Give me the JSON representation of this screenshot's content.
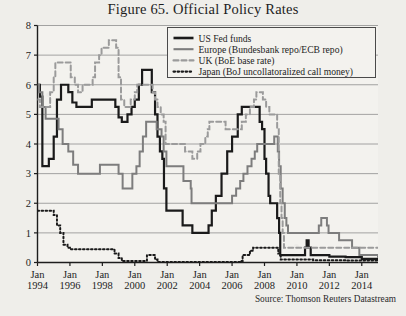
{
  "figure": {
    "title": "Figure 65. Official Policy Rates",
    "source": "Source: Thomson Reuters Datastream"
  },
  "chart_data": {
    "type": "line",
    "title": "Figure 65. Official Policy Rates",
    "xlabel": "",
    "ylabel": "",
    "ylim": [
      0,
      8
    ],
    "xlim": [
      1994,
      2015
    ],
    "grid": true,
    "legend_position": "top-right",
    "yticks": [
      0,
      1,
      2,
      3,
      4,
      5,
      6,
      7,
      8
    ],
    "xticks": [
      1994,
      1996,
      1998,
      2000,
      2002,
      2004,
      2006,
      2008,
      2010,
      2012,
      2014
    ],
    "xtick_labels": [
      "Jan\n1994",
      "Jan\n1996",
      "Jan\n1998",
      "Jan\n2000",
      "Jan\n2002",
      "Jan\n2004",
      "Jan\n2006",
      "Jan\n2008",
      "Jan\n2010",
      "Jan\n2012",
      "Jan\n2014"
    ],
    "xtick_top": [
      "Jan",
      "Jan",
      "Jan",
      "Jan",
      "Jan",
      "Jan",
      "Jan",
      "Jan",
      "Jan",
      "Jan",
      "Jan"
    ],
    "xtick_bottom": [
      "1994",
      "1996",
      "1998",
      "2000",
      "2002",
      "2004",
      "2006",
      "2008",
      "2010",
      "2012",
      "2014"
    ],
    "series": [
      {
        "name": "US Fed funds",
        "legend_label": "US Fed funds",
        "color": "#1a1a1a",
        "style": "solid",
        "width": 2.2,
        "points": [
          [
            1994.0,
            6.0
          ],
          [
            1994.15,
            5.6
          ],
          [
            1994.3,
            3.25
          ],
          [
            1994.5,
            3.25
          ],
          [
            1994.7,
            3.5
          ],
          [
            1995.0,
            4.25
          ],
          [
            1995.2,
            5.5
          ],
          [
            1995.45,
            6.0
          ],
          [
            1995.9,
            5.75
          ],
          [
            1996.15,
            5.4
          ],
          [
            1996.4,
            5.25
          ],
          [
            1997.2,
            5.25
          ],
          [
            1997.35,
            5.5
          ],
          [
            1998.65,
            5.5
          ],
          [
            1998.8,
            5.25
          ],
          [
            1999.0,
            4.9
          ],
          [
            1999.2,
            4.75
          ],
          [
            1999.55,
            5.0
          ],
          [
            1999.8,
            5.25
          ],
          [
            2000.0,
            5.5
          ],
          [
            2000.25,
            6.0
          ],
          [
            2000.45,
            6.5
          ],
          [
            2000.95,
            6.5
          ],
          [
            2001.05,
            5.75
          ],
          [
            2001.25,
            5.0
          ],
          [
            2001.4,
            4.25
          ],
          [
            2001.55,
            3.75
          ],
          [
            2001.7,
            3.5
          ],
          [
            2001.8,
            2.5
          ],
          [
            2001.95,
            1.75
          ],
          [
            2002.85,
            1.75
          ],
          [
            2002.95,
            1.25
          ],
          [
            2003.5,
            1.25
          ],
          [
            2003.55,
            1.0
          ],
          [
            2004.4,
            1.0
          ],
          [
            2004.55,
            1.25
          ],
          [
            2004.75,
            1.75
          ],
          [
            2005.0,
            2.25
          ],
          [
            2005.35,
            3.0
          ],
          [
            2005.7,
            3.75
          ],
          [
            2006.0,
            4.25
          ],
          [
            2006.35,
            5.0
          ],
          [
            2006.6,
            5.25
          ],
          [
            2007.6,
            5.25
          ],
          [
            2007.7,
            4.75
          ],
          [
            2007.85,
            4.5
          ],
          [
            2008.0,
            3.5
          ],
          [
            2008.1,
            3.0
          ],
          [
            2008.25,
            2.25
          ],
          [
            2008.35,
            2.0
          ],
          [
            2008.78,
            1.5
          ],
          [
            2008.9,
            1.0
          ],
          [
            2008.97,
            0.25
          ],
          [
            2010.4,
            0.25
          ],
          [
            2010.5,
            0.5
          ],
          [
            2010.6,
            0.75
          ],
          [
            2010.72,
            0.5
          ],
          [
            2010.85,
            0.25
          ],
          [
            2012.0,
            0.2
          ],
          [
            2013.0,
            0.18
          ],
          [
            2014.0,
            0.12
          ],
          [
            2015.0,
            0.12
          ]
        ]
      },
      {
        "name": "Europe (Bundesbank repo/ECB repo)",
        "legend_label": "Europe (Bundesbank repo/ECB repo)",
        "color": "#7d7d7d",
        "style": "solid",
        "width": 2.0,
        "points": [
          [
            1994.0,
            6.0
          ],
          [
            1994.1,
            5.75
          ],
          [
            1994.3,
            5.25
          ],
          [
            1994.5,
            4.85
          ],
          [
            1994.75,
            4.85
          ],
          [
            1995.0,
            4.85
          ],
          [
            1995.3,
            4.5
          ],
          [
            1995.55,
            4.0
          ],
          [
            1995.9,
            3.75
          ],
          [
            1996.2,
            3.3
          ],
          [
            1996.5,
            3.0
          ],
          [
            1997.5,
            3.0
          ],
          [
            1997.85,
            3.3
          ],
          [
            1998.7,
            3.3
          ],
          [
            1999.0,
            3.0
          ],
          [
            1999.25,
            2.5
          ],
          [
            1999.85,
            3.0
          ],
          [
            2000.1,
            3.25
          ],
          [
            2000.3,
            3.75
          ],
          [
            2000.5,
            4.25
          ],
          [
            2000.7,
            4.75
          ],
          [
            2000.85,
            4.75
          ],
          [
            2001.35,
            4.5
          ],
          [
            2001.65,
            4.25
          ],
          [
            2001.78,
            3.75
          ],
          [
            2001.95,
            3.25
          ],
          [
            2002.95,
            3.25
          ],
          [
            2003.0,
            2.75
          ],
          [
            2003.45,
            2.5
          ],
          [
            2003.5,
            2.0
          ],
          [
            2005.95,
            2.0
          ],
          [
            2006.0,
            2.25
          ],
          [
            2006.25,
            2.5
          ],
          [
            2006.5,
            2.75
          ],
          [
            2006.7,
            3.0
          ],
          [
            2006.95,
            3.25
          ],
          [
            2007.2,
            3.5
          ],
          [
            2007.4,
            3.75
          ],
          [
            2007.55,
            4.0
          ],
          [
            2008.5,
            4.0
          ],
          [
            2008.6,
            4.25
          ],
          [
            2008.82,
            3.75
          ],
          [
            2008.9,
            3.25
          ],
          [
            2009.0,
            2.5
          ],
          [
            2009.12,
            2.0
          ],
          [
            2009.25,
            1.5
          ],
          [
            2009.35,
            1.25
          ],
          [
            2009.45,
            1.0
          ],
          [
            2011.25,
            1.0
          ],
          [
            2011.35,
            1.25
          ],
          [
            2011.5,
            1.5
          ],
          [
            2011.85,
            1.25
          ],
          [
            2011.95,
            1.0
          ],
          [
            2012.6,
            0.75
          ],
          [
            2013.4,
            0.5
          ],
          [
            2013.85,
            0.25
          ],
          [
            2015.0,
            0.15
          ]
        ]
      },
      {
        "name": "UK (BoE base rate)",
        "legend_label": "UK (BoE base rate)",
        "color": "#9b9b9b",
        "style": "dashed",
        "width": 2.0,
        "points": [
          [
            1994.0,
            5.5
          ],
          [
            1994.15,
            5.25
          ],
          [
            1994.7,
            5.25
          ],
          [
            1994.78,
            5.75
          ],
          [
            1995.0,
            6.25
          ],
          [
            1995.1,
            6.75
          ],
          [
            1995.95,
            6.75
          ],
          [
            1996.05,
            6.25
          ],
          [
            1996.3,
            6.0
          ],
          [
            1996.5,
            5.75
          ],
          [
            1996.78,
            6.0
          ],
          [
            1997.0,
            6.0
          ],
          [
            1997.4,
            6.25
          ],
          [
            1997.55,
            6.75
          ],
          [
            1997.8,
            7.0
          ],
          [
            1997.95,
            7.25
          ],
          [
            1998.4,
            7.5
          ],
          [
            1998.75,
            7.5
          ],
          [
            1998.85,
            7.25
          ],
          [
            1999.0,
            6.25
          ],
          [
            1999.15,
            5.5
          ],
          [
            1999.35,
            5.25
          ],
          [
            1999.75,
            5.5
          ],
          [
            2000.0,
            5.75
          ],
          [
            2000.15,
            6.0
          ],
          [
            2000.95,
            6.0
          ],
          [
            2001.1,
            5.75
          ],
          [
            2001.25,
            5.5
          ],
          [
            2001.4,
            5.25
          ],
          [
            2001.6,
            5.0
          ],
          [
            2001.78,
            4.75
          ],
          [
            2001.9,
            4.0
          ],
          [
            2002.0,
            4.0
          ],
          [
            2003.1,
            3.75
          ],
          [
            2003.55,
            3.5
          ],
          [
            2003.85,
            3.75
          ],
          [
            2004.05,
            4.0
          ],
          [
            2004.35,
            4.25
          ],
          [
            2004.5,
            4.5
          ],
          [
            2004.6,
            4.75
          ],
          [
            2005.6,
            4.5
          ],
          [
            2006.6,
            4.75
          ],
          [
            2006.85,
            5.0
          ],
          [
            2007.1,
            5.25
          ],
          [
            2007.35,
            5.5
          ],
          [
            2007.5,
            5.75
          ],
          [
            2007.9,
            5.5
          ],
          [
            2008.1,
            5.25
          ],
          [
            2008.3,
            5.0
          ],
          [
            2008.78,
            4.5
          ],
          [
            2008.88,
            3.0
          ],
          [
            2008.97,
            2.0
          ],
          [
            2009.05,
            1.5
          ],
          [
            2009.12,
            1.0
          ],
          [
            2009.2,
            0.5
          ],
          [
            2012.0,
            0.5
          ],
          [
            2013.5,
            0.5
          ],
          [
            2015.0,
            0.5
          ]
        ]
      },
      {
        "name": "Japan (BoJ uncollatoralized call money)",
        "legend_label": "Japan (BoJ uncollatoralized call money)",
        "color": "#1a1a1a",
        "style": "dotted",
        "width": 2.0,
        "points": [
          [
            1994.0,
            1.75
          ],
          [
            1994.9,
            1.75
          ],
          [
            1995.0,
            1.6
          ],
          [
            1995.2,
            1.25
          ],
          [
            1995.4,
            1.0
          ],
          [
            1995.6,
            0.6
          ],
          [
            1995.85,
            0.5
          ],
          [
            1996.0,
            0.45
          ],
          [
            1996.3,
            0.45
          ],
          [
            1998.6,
            0.45
          ],
          [
            1998.75,
            0.3
          ],
          [
            1999.0,
            0.15
          ],
          [
            1999.2,
            0.05
          ],
          [
            2000.6,
            0.05
          ],
          [
            2000.75,
            0.25
          ],
          [
            2001.1,
            0.25
          ],
          [
            2001.25,
            0.1
          ],
          [
            2001.4,
            0.02
          ],
          [
            2005.8,
            0.02
          ],
          [
            2006.5,
            0.05
          ],
          [
            2006.65,
            0.25
          ],
          [
            2007.1,
            0.4
          ],
          [
            2007.3,
            0.5
          ],
          [
            2008.6,
            0.5
          ],
          [
            2008.85,
            0.3
          ],
          [
            2009.0,
            0.1
          ],
          [
            2009.2,
            0.1
          ],
          [
            2011.0,
            0.08
          ],
          [
            2013.0,
            0.07
          ],
          [
            2015.0,
            0.06
          ]
        ]
      }
    ]
  },
  "legend": {
    "entries": [
      {
        "label": "US Fed funds",
        "swatch": "solid-thick-black"
      },
      {
        "label": "Europe (Bundesbank repo/ECB repo)",
        "swatch": "solid-gray"
      },
      {
        "label": "UK (BoE base rate)",
        "swatch": "dashed-gray"
      },
      {
        "label": "Japan (BoJ uncollatoralized call money)",
        "swatch": "dotted-black"
      }
    ]
  }
}
